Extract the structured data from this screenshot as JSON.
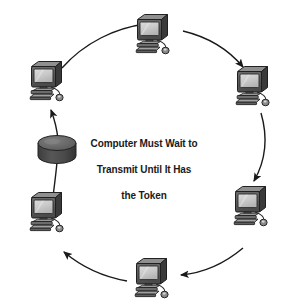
{
  "diagram": {
    "caption": {
      "line1": "Computer Must Wait to",
      "line2": "Transmit Until It Has",
      "line3": "the Token"
    },
    "colors": {
      "background": "#ffffff",
      "monitor_case": "#4f4f4f",
      "monitor_case_light": "#8d8d8d",
      "monitor_case_dark": "#2e2e2e",
      "screen": "#c9c9c9",
      "screen_highlight": "#dedede",
      "base": "#7d7d7d",
      "base_dark": "#3b3b3b",
      "token_top": "#6e6e6e",
      "token_body": "#4a4a4a",
      "line": "#1a1a1a",
      "text": "#1a1a1a"
    },
    "nodes": [
      {
        "id": "computer-top",
        "label": "Computer Top",
        "x": 152,
        "y": 34,
        "angle_deg": 270
      },
      {
        "id": "computer-top-right",
        "label": "Computer Top Right",
        "x": 252,
        "y": 86,
        "angle_deg": 330
      },
      {
        "id": "computer-bottom-right",
        "label": "Computer Bottom Right",
        "x": 250,
        "y": 206,
        "angle_deg": 30
      },
      {
        "id": "computer-bottom",
        "label": "Computer Bottom",
        "x": 151,
        "y": 278,
        "angle_deg": 90
      },
      {
        "id": "computer-bottom-left",
        "label": "Computer Bottom Left",
        "x": 46,
        "y": 212,
        "angle_deg": 150
      },
      {
        "id": "computer-top-left",
        "label": "Computer Top Left",
        "x": 46,
        "y": 81,
        "angle_deg": 210
      }
    ],
    "token": {
      "id": "token",
      "label": "Token",
      "x": 57,
      "y": 149
    },
    "links": [
      {
        "id": "link-top-left-to-top",
        "from": "computer-top-left",
        "to": "computer-top",
        "arrow": true
      },
      {
        "id": "link-top-to-top-right",
        "from": "computer-top",
        "to": "computer-top-right",
        "arrow": true
      },
      {
        "id": "link-top-right-to-bottom-right",
        "from": "computer-top-right",
        "to": "computer-bottom-right",
        "arrow": true
      },
      {
        "id": "link-bottom-right-to-bottom",
        "from": "computer-bottom-right",
        "to": "computer-bottom",
        "arrow": true
      },
      {
        "id": "link-bottom-to-bottom-left",
        "from": "computer-bottom",
        "to": "computer-bottom-left",
        "arrow": true
      },
      {
        "id": "link-bottom-left-to-token",
        "from": "computer-bottom-left",
        "to": "token",
        "arrow": false
      },
      {
        "id": "link-token-to-top-left",
        "from": "token",
        "to": "computer-top-left",
        "arrow": true
      }
    ],
    "flow_direction": "clockwise"
  }
}
